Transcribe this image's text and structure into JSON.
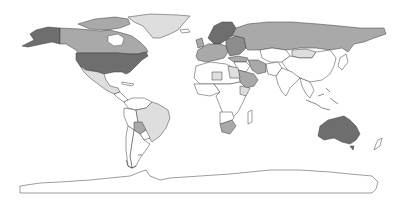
{
  "map": {
    "type": "choropleth",
    "projection": "equirectangular",
    "palette": {
      "level_3_dark": "#6e6e6e",
      "level_2_medium": "#a9a9a9",
      "level_1_light": "#dedede",
      "level_0_none": "#ffffff",
      "border": "#3a3a3a"
    },
    "regions": [
      {
        "name": "United States",
        "level": 3
      },
      {
        "name": "Alaska",
        "level": 3
      },
      {
        "name": "Australia",
        "level": 3
      },
      {
        "name": "Canada",
        "level": 2
      },
      {
        "name": "Russia",
        "level": 2
      },
      {
        "name": "Scandinavia",
        "level": 3
      },
      {
        "name": "Western Europe",
        "level": 2
      },
      {
        "name": "Saudi Arabia",
        "level": 2
      },
      {
        "name": "Iran",
        "level": 2
      },
      {
        "name": "Greenland",
        "level": 1
      },
      {
        "name": "Mexico",
        "level": 1
      },
      {
        "name": "Brazil",
        "level": 1
      },
      {
        "name": "Bolivia",
        "level": 2
      },
      {
        "name": "Kazakhstan",
        "level": 1
      },
      {
        "name": "Mongolia",
        "level": 1
      },
      {
        "name": "Egypt",
        "level": 1
      },
      {
        "name": "South Africa",
        "level": 2
      },
      {
        "name": "Chile",
        "level": 0
      },
      {
        "name": "Argentina",
        "level": 0
      },
      {
        "name": "China",
        "level": 0
      },
      {
        "name": "India",
        "level": 0
      },
      {
        "name": "Africa (other)",
        "level": 0
      },
      {
        "name": "Antarctica",
        "level": 0
      }
    ]
  }
}
